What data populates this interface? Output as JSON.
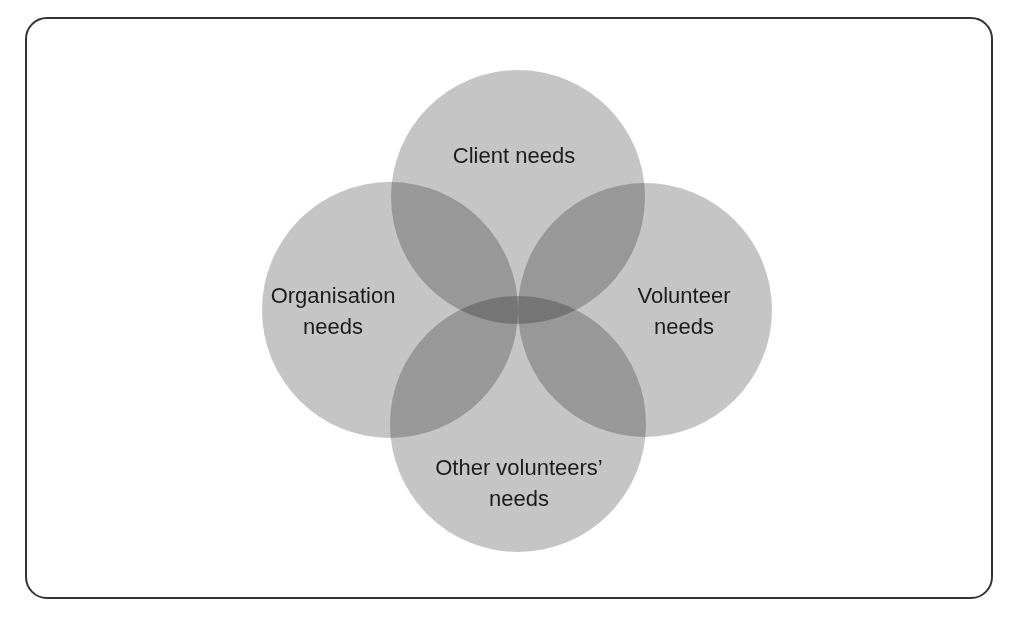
{
  "figure": {
    "kind": "venn-diagram",
    "background_color": "#ffffff",
    "frame": {
      "border_color": "#333333",
      "border_width_px": 2,
      "corner_radius_px": 22
    }
  },
  "chart_data": {
    "type": "venn",
    "title": "",
    "subtitle": "",
    "set_count": 4,
    "layout": "diamond",
    "legend_position": "none",
    "grid": false,
    "palette": {
      "circle_fill": "#c5c5c5",
      "two_way_overlap": "#8e8e8e",
      "three_way_overlap": "#5a5a5a",
      "four_way_overlap": "#383838",
      "label_text": "#1c1c1c",
      "frame_border": "#333333",
      "background": "#ffffff"
    },
    "sets": [
      {
        "id": "client",
        "label": "Client needs",
        "position": "top",
        "cx": 518,
        "cy": 197,
        "r": 127
      },
      {
        "id": "organisation",
        "label": "Organisation\nneeds",
        "position": "left",
        "cx": 390,
        "cy": 310,
        "r": 128
      },
      {
        "id": "volunteer",
        "label": "Volunteer\nneeds",
        "position": "right",
        "cx": 645,
        "cy": 310,
        "r": 127
      },
      {
        "id": "other_volunteers",
        "label": "Other volunteers’\nneeds",
        "position": "bottom",
        "cx": 518,
        "cy": 424,
        "r": 128
      }
    ],
    "intersections": [
      {
        "sets": [
          "client",
          "organisation"
        ],
        "shade": "#8e8e8e"
      },
      {
        "sets": [
          "client",
          "volunteer"
        ],
        "shade": "#8e8e8e"
      },
      {
        "sets": [
          "organisation",
          "other_volunteers"
        ],
        "shade": "#8e8e8e"
      },
      {
        "sets": [
          "volunteer",
          "other_volunteers"
        ],
        "shade": "#8e8e8e"
      },
      {
        "sets": [
          "client",
          "other_volunteers"
        ],
        "shade": "#5a5a5a"
      },
      {
        "sets": [
          "organisation",
          "volunteer"
        ],
        "shade": "#5a5a5a"
      },
      {
        "sets": [
          "client",
          "organisation",
          "volunteer",
          "other_volunteers"
        ],
        "shade": "#383838"
      }
    ]
  },
  "labels": {
    "client": "Client needs",
    "organisation": "Organisation\nneeds",
    "volunteer": "Volunteer\nneeds",
    "other_volunteers": "Other volunteers’\nneeds"
  }
}
